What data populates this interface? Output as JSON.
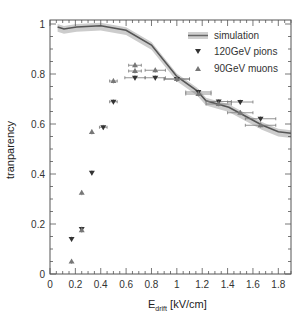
{
  "chart_data": {
    "type": "scatter",
    "title": "",
    "xlabel": "E_drift [kV/cm]",
    "xlabel_main": "E",
    "xlabel_sub": "drift",
    "xlabel_unit": " [kV/cm]",
    "ylabel": "tranparency",
    "xlim": [
      0,
      1.9
    ],
    "ylim": [
      0,
      1.016
    ],
    "xticks": [
      0,
      0.2,
      0.4,
      0.6,
      0.8,
      1,
      1.2,
      1.4,
      1.6,
      1.8
    ],
    "xtick_labels": [
      "0",
      "0.2",
      "0.4",
      "0.6",
      "0.8",
      "1",
      "1.2",
      "1.4",
      "1.6",
      "1.8"
    ],
    "yticks": [
      0,
      0.2,
      0.4,
      0.6,
      0.8,
      1
    ],
    "ytick_labels": [
      "0",
      "0.2",
      "0.4",
      "0.6",
      "0.8",
      "1"
    ],
    "grid": false,
    "legend_position": "upper right",
    "legend": [
      "simulation",
      "120GeV pions",
      "90GeV muons"
    ],
    "series": [
      {
        "name": "simulation",
        "kind": "line-with-band",
        "color": "#555555",
        "band_color": "#cccccc",
        "x": [
          0.06,
          0.11,
          0.21,
          0.4,
          0.6,
          0.8,
          1.0,
          1.16,
          1.23,
          1.41,
          1.67,
          1.8,
          1.9
        ],
        "y": [
          0.988,
          0.98,
          0.988,
          0.993,
          0.975,
          0.916,
          0.79,
          0.733,
          0.693,
          0.667,
          0.596,
          0.569,
          0.563
        ],
        "band_halfwidth": 0.012
      },
      {
        "name": "120GeV pions",
        "kind": "marker",
        "marker": "triangle-down",
        "color": "#333333",
        "x": [
          0.17,
          0.25,
          0.33,
          0.42,
          0.5,
          0.67,
          0.83,
          1.0,
          1.17,
          1.33,
          1.5,
          1.66
        ],
        "y": [
          0.14,
          0.18,
          0.405,
          0.587,
          0.689,
          0.785,
          0.785,
          0.78,
          0.728,
          0.69,
          0.688,
          0.621
        ],
        "xerr": [
          0.0,
          0.0,
          0.0,
          0.03,
          0.03,
          0.08,
          0.08,
          0.1,
          0.1,
          0.1,
          0.1,
          0.12
        ]
      },
      {
        "name": "90GeV muons",
        "kind": "marker",
        "marker": "triangle-up",
        "color": "#777777",
        "x": [
          0.17,
          0.25,
          0.25,
          0.33,
          0.5,
          0.67,
          0.67,
          0.83,
          1.0,
          1.17,
          1.33,
          1.5,
          1.66
        ],
        "y": [
          0.05,
          0.325,
          0.175,
          0.568,
          0.772,
          0.835,
          0.812,
          0.815,
          0.78,
          0.72,
          0.68,
          0.645,
          0.595
        ],
        "xerr": [
          0.0,
          0.0,
          0.0,
          0.0,
          0.03,
          0.05,
          0.05,
          0.08,
          0.1,
          0.1,
          0.1,
          0.1,
          0.12
        ]
      }
    ]
  },
  "legend": {
    "items": [
      {
        "label": "simulation"
      },
      {
        "label": "120GeV pions"
      },
      {
        "label": "90GeV muons"
      }
    ]
  }
}
